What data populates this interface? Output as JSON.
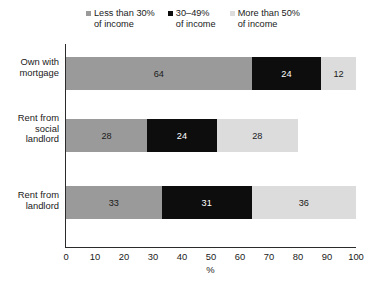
{
  "chart_data": {
    "type": "bar",
    "orientation": "horizontal",
    "stacked": true,
    "title": "",
    "xlabel": "%",
    "ylabel": "",
    "xlim": [
      0,
      100
    ],
    "xticks": [
      0,
      10,
      20,
      30,
      40,
      50,
      60,
      70,
      80,
      90,
      100
    ],
    "grid": false,
    "legend_position": "top",
    "categories": [
      "Own with mortgage",
      "Rent from social landlord",
      "Rent from landlord"
    ],
    "category_lines": [
      [
        "Own with",
        "mortgage"
      ],
      [
        "Rent from",
        "social",
        "landlord"
      ],
      [
        "Rent from",
        "landlord"
      ]
    ],
    "series": [
      {
        "name": "Less than 30% of income",
        "name_lines": [
          "Less than 30%",
          "of income"
        ],
        "color": "#9a9a9a",
        "label_color": "#1a1a1a",
        "values": [
          64,
          28,
          33
        ]
      },
      {
        "name": "30–49% of income",
        "name_lines": [
          "30–49%",
          "of income"
        ],
        "color": "#0d0d0d",
        "label_color": "#ffffff",
        "values": [
          24,
          24,
          31
        ]
      },
      {
        "name": "More than 50% of income",
        "name_lines": [
          "More than 50%",
          "of income"
        ],
        "color": "#dcdcdc",
        "label_color": "#1a1a1a",
        "values": [
          12,
          28,
          36
        ]
      }
    ]
  },
  "axis": {
    "tick_labels": [
      "0",
      "10",
      "20",
      "30",
      "40",
      "50",
      "60",
      "70",
      "80",
      "90",
      "100"
    ],
    "title": "%"
  },
  "legend": {
    "items": [
      {
        "line1": "Less than 30%",
        "line2": "of income",
        "color": "#9a9a9a"
      },
      {
        "line1": "30–49%",
        "line2": "of income",
        "color": "#0d0d0d"
      },
      {
        "line1": "More than 50%",
        "line2": "of income",
        "color": "#dcdcdc"
      }
    ]
  },
  "caption": {
    "text": ""
  }
}
